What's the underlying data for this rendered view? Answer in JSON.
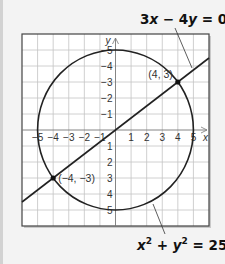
{
  "figure": {
    "line_equation": {
      "lhs": "3x − 4y = 0",
      "parts": [
        "3",
        "x",
        " − 4",
        "y",
        " = 0"
      ]
    },
    "circle_equation": {
      "parts": [
        "x",
        "2",
        " + ",
        "y",
        "2",
        " = 25"
      ]
    },
    "axis_labels": {
      "x": "x",
      "y": "y"
    },
    "x_tick_labels": [
      "−5",
      "−4",
      "−3",
      "−2",
      "−1",
      "1",
      "2",
      "3",
      "4",
      "5"
    ],
    "y_tick_labels": [
      "5",
      "4",
      "3",
      "2",
      "1",
      "−1",
      "−2",
      "−3",
      "−4",
      "−5"
    ],
    "points": [
      {
        "label": "(4, 3)",
        "x": 4,
        "y": 3
      },
      {
        "label": "(−4, −3)",
        "x": -4,
        "y": -3
      }
    ]
  },
  "chart_data": {
    "type": "line",
    "title": "",
    "xlabel": "x",
    "ylabel": "y",
    "xlim": [
      -6,
      6
    ],
    "ylim": [
      -6,
      6
    ],
    "grid": true,
    "x_ticks": [
      -5,
      -4,
      -3,
      -2,
      -1,
      1,
      2,
      3,
      4,
      5
    ],
    "y_ticks": [
      -5,
      -4,
      -3,
      -2,
      -1,
      1,
      2,
      3,
      4,
      5
    ],
    "series": [
      {
        "name": "3x − 4y = 0",
        "kind": "line",
        "slope": 0.75,
        "intercept": 0
      },
      {
        "name": "x² + y² = 25",
        "kind": "circle",
        "center": [
          0,
          0
        ],
        "radius": 5
      }
    ],
    "intersections": [
      [
        4,
        3
      ],
      [
        -4,
        -3
      ]
    ],
    "annotations": [
      "3x − 4y = 0",
      "x² + y² = 25",
      "(4, 3)",
      "(−4, −3)"
    ]
  }
}
